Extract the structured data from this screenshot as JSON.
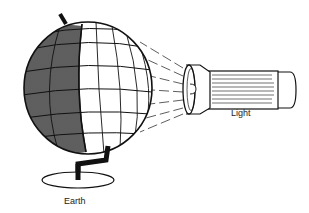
{
  "diagram": {
    "type": "illustration",
    "labels": {
      "earth": "Earth",
      "light": "Light"
    },
    "elements": [
      {
        "id": "globe",
        "label": "Earth",
        "note": "left half shaded (night), right half lit (day)"
      },
      {
        "id": "flashlight",
        "label": "Light",
        "note": "beam rays directed toward globe"
      }
    ],
    "colors": {
      "ink": "#111111",
      "background": "#ffffff"
    }
  }
}
